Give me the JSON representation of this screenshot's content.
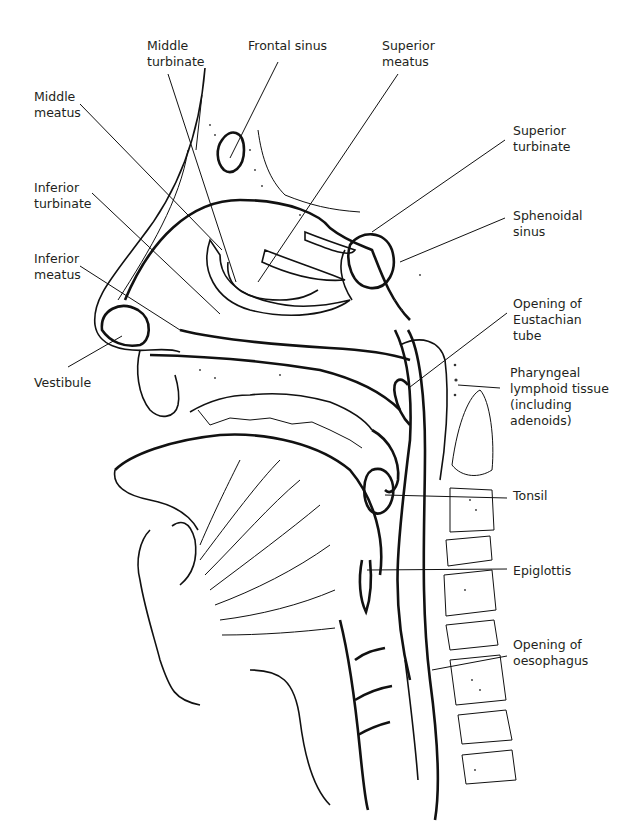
{
  "diagram": {
    "colors": {
      "ink": "#111111",
      "label_text": "#231f20",
      "background": "#ffffff"
    },
    "labels": [
      {
        "id": "middle-turbinate",
        "text": "Middle\nturbinate",
        "x": 147,
        "y": 38
      },
      {
        "id": "frontal-sinus",
        "text": "Frontal sinus",
        "x": 248,
        "y": 38
      },
      {
        "id": "superior-meatus",
        "text": "Superior\nmeatus",
        "x": 382,
        "y": 38
      },
      {
        "id": "middle-meatus",
        "text": "Middle\nmeatus",
        "x": 34,
        "y": 89
      },
      {
        "id": "superior-turbinate",
        "text": "Superior\nturbinate",
        "x": 513,
        "y": 123
      },
      {
        "id": "inferior-turbinate",
        "text": "Inferior\nturbinate",
        "x": 34,
        "y": 180
      },
      {
        "id": "sphenoidal-sinus",
        "text": "Sphenoidal\nsinus",
        "x": 513,
        "y": 208
      },
      {
        "id": "inferior-meatus",
        "text": "Inferior\nmeatus",
        "x": 34,
        "y": 251
      },
      {
        "id": "opening-eustachian-tube",
        "text": "Opening of\nEustachian\ntube",
        "x": 513,
        "y": 296
      },
      {
        "id": "vestibule",
        "text": "Vestibule",
        "x": 34,
        "y": 375
      },
      {
        "id": "pharyngeal-lymphoid-tissue",
        "text": "Pharyngeal\nlymphoid tissue\n(including\nadenoids)",
        "x": 510,
        "y": 365
      },
      {
        "id": "tonsil",
        "text": "Tonsil",
        "x": 513,
        "y": 488
      },
      {
        "id": "epiglottis",
        "text": "Epiglottis",
        "x": 513,
        "y": 563
      },
      {
        "id": "opening-oesophagus",
        "text": "Opening of\noesophagus",
        "x": 513,
        "y": 637
      }
    ],
    "leaders": [
      {
        "label": "middle-turbinate",
        "x1": 168,
        "y1": 74,
        "x2": 236,
        "y2": 282
      },
      {
        "label": "frontal-sinus",
        "x1": 278,
        "y1": 62,
        "x2": 230,
        "y2": 158
      },
      {
        "label": "superior-meatus",
        "x1": 398,
        "y1": 74,
        "x2": 258,
        "y2": 282
      },
      {
        "label": "middle-meatus",
        "x1": 80,
        "y1": 104,
        "x2": 222,
        "y2": 250
      },
      {
        "label": "superior-turbinate",
        "x1": 505,
        "y1": 140,
        "x2": 372,
        "y2": 232
      },
      {
        "label": "inferior-turbinate",
        "x1": 92,
        "y1": 193,
        "x2": 220,
        "y2": 314
      },
      {
        "label": "sphenoidal-sinus",
        "x1": 505,
        "y1": 218,
        "x2": 400,
        "y2": 262
      },
      {
        "label": "inferior-meatus",
        "x1": 80,
        "y1": 266,
        "x2": 180,
        "y2": 330
      },
      {
        "label": "opening-eustachian-tube",
        "x1": 507,
        "y1": 313,
        "x2": 410,
        "y2": 387
      },
      {
        "label": "pharyngeal-lymphoid-tissue",
        "x1": 500,
        "y1": 388,
        "x2": 458,
        "y2": 385
      },
      {
        "label": "tonsil",
        "x1": 507,
        "y1": 498,
        "x2": 385,
        "y2": 495
      },
      {
        "label": "epiglottis",
        "x1": 507,
        "y1": 569,
        "x2": 367,
        "y2": 570
      },
      {
        "label": "opening-oesophagus",
        "x1": 507,
        "y1": 656,
        "x2": 432,
        "y2": 670
      },
      {
        "label": "vestibule",
        "x1": 68,
        "y1": 367,
        "x2": 122,
        "y2": 336
      }
    ]
  }
}
